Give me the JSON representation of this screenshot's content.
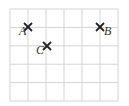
{
  "grid": {
    "origin_x": 10,
    "origin_y": 9,
    "cell_w": 18,
    "cell_h": 18.4,
    "cols": 6,
    "rows": 5,
    "line_color": "#d4d4d4"
  },
  "points": [
    {
      "label": "A",
      "x": 28,
      "y": 27,
      "label_dx": -9,
      "label_dy": 8
    },
    {
      "label": "B",
      "x": 100,
      "y": 27,
      "label_dx": 4,
      "label_dy": 8
    },
    {
      "label": "C",
      "x": 47,
      "y": 46,
      "label_dx": -11,
      "label_dy": 8
    }
  ],
  "marker_color": "#222222"
}
